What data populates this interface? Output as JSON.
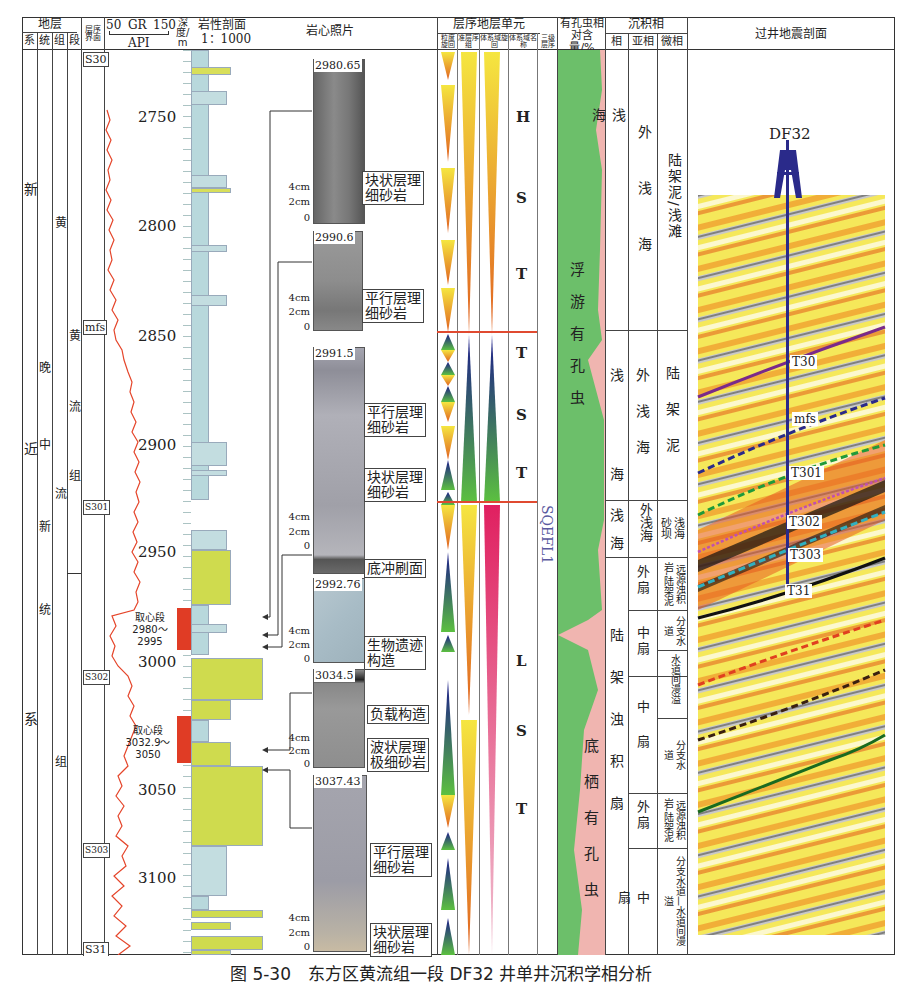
{
  "header": {
    "strata": "地层",
    "strata_sub": [
      "系",
      "统",
      "组",
      "段"
    ],
    "seq_boundary": "层序界面",
    "gr_min": "50",
    "gr_label": "GR",
    "gr_max": "150",
    "gr_unit": "API",
    "depth_label": "深度/m",
    "litho_label": "岩性剖面",
    "litho_scale": "1：1000",
    "core_photo": "岩心照片",
    "seq_unit": "层序地层单元",
    "seq_sub": [
      "粒度旋回",
      "准层序组",
      "体系域旋回",
      "体系域名称",
      "三级层序"
    ],
    "foram": "有孔虫相对含量/%",
    "facies": "沉积相",
    "facies_sub": [
      "相",
      "亚相",
      "微相"
    ],
    "seismic": "过井地震剖面"
  },
  "strata": {
    "system": [
      "新",
      "近",
      "系"
    ],
    "series": [
      "晚",
      "中",
      "新",
      "统"
    ],
    "formation_upper": [
      "黄",
      "流",
      "组"
    ],
    "formation_lower": [
      "黄",
      "流",
      "组"
    ],
    "member_upper": [
      "黄",
      "流",
      "组"
    ]
  },
  "seq_boundaries": [
    {
      "label": "S30",
      "y": 58
    },
    {
      "label": "mfs",
      "y": 325
    },
    {
      "label": "S301",
      "y": 500
    },
    {
      "label": "S302",
      "y": 670
    },
    {
      "label": "S303",
      "y": 843
    },
    {
      "label": "S31",
      "y": 940
    }
  ],
  "depth_ticks": [
    {
      "label": "2750",
      "y": 118
    },
    {
      "label": "2800",
      "y": 227
    },
    {
      "label": "2850",
      "y": 337
    },
    {
      "label": "2900",
      "y": 446
    },
    {
      "label": "2950",
      "y": 553
    },
    {
      "label": "3000",
      "y": 663
    },
    {
      "label": "3050",
      "y": 791
    },
    {
      "label": "3100",
      "y": 879
    }
  ],
  "core_intervals": [
    {
      "label": "取心段",
      "range": "2980～2995",
      "y": 608,
      "h": 42
    },
    {
      "label": "取心段",
      "range": "3032.9～3050",
      "y": 716,
      "h": 47
    }
  ],
  "core_photos": [
    {
      "depth": "2980.65",
      "notes": [
        {
          "l1": "块状层理",
          "l2": "细砂岩"
        }
      ]
    },
    {
      "depth": "2990.6",
      "notes": [
        {
          "l1": "平行层理",
          "l2": "细砂岩"
        }
      ]
    },
    {
      "depth": "2991.5",
      "notes": [
        {
          "l1": "平行层理",
          "l2": "细砂岩"
        },
        {
          "l1": "块状层理",
          "l2": "细砂岩"
        },
        {
          "l1": "底冲刷面",
          "l2": ""
        }
      ]
    },
    {
      "depth": "2992.76",
      "notes": [
        {
          "l1": "生物遗迹",
          "l2": "构造"
        }
      ]
    },
    {
      "depth": "3034.5",
      "notes": [
        {
          "l1": "负载构造",
          "l2": ""
        },
        {
          "l1": "波状层理",
          "l2": "极细砂岩"
        }
      ]
    },
    {
      "depth": "3037.43",
      "notes": [
        {
          "l1": "平行层理",
          "l2": "细砂岩"
        },
        {
          "l1": "块状层理",
          "l2": "细砂岩"
        }
      ]
    }
  ],
  "scale_labels": [
    "4cm",
    "2cm",
    "0"
  ],
  "systems_tracts": [
    {
      "letters": [
        "H",
        "S",
        "T"
      ]
    },
    {
      "letters": [
        "T",
        "S",
        "T"
      ]
    },
    {
      "letters": [
        "L",
        "S",
        "T"
      ]
    }
  ],
  "third_order_sequence": "SQEFL1",
  "foram_labels": {
    "planktonic": [
      "浮",
      "游",
      "有",
      "孔",
      "虫"
    ],
    "benthic": [
      "底",
      "栖",
      "有",
      "孔",
      "虫"
    ]
  },
  "facies_rows": [
    {
      "facies": "浅海",
      "subfacies": "外浅海",
      "micro": "陆架泥/浅滩"
    },
    {
      "facies": "浅海",
      "subfacies": "外浅海",
      "micro": "陆架泥"
    },
    {
      "facies": "浅海",
      "subfacies": "外浅海",
      "micro": "浅海砂坝"
    },
    {
      "facies": "陆架浊积扇",
      "subfacies": "外扇",
      "micro": "远源浊积岩-陆架泥"
    },
    {
      "facies": "",
      "subfacies": "中扇",
      "micro": "分支水道"
    },
    {
      "facies": "",
      "subfacies": "",
      "micro": "水道间漫溢"
    },
    {
      "facies": "",
      "subfacies": "中扇",
      "micro": "分支水道"
    },
    {
      "facies": "",
      "subfacies": "外扇",
      "micro": "远源浊积岩-陆架泥"
    },
    {
      "facies": "",
      "subfacies": "中扇",
      "micro": "分支水道—水道间漫溢"
    }
  ],
  "seismic": {
    "well": "DF32",
    "horizons": [
      {
        "label": "T30",
        "color": "#7a2a8a",
        "style": "solid"
      },
      {
        "label": "mfs",
        "color": "#2a2a8a",
        "style": "dashed"
      },
      {
        "label": "T301",
        "color": "#1f9a3a",
        "style": "dashed"
      },
      {
        "label": "T302",
        "color": "#c050b0",
        "style": "dotted"
      },
      {
        "label": "T303",
        "color": "#30b0c0",
        "style": "dashed"
      },
      {
        "label": "T31",
        "color": "#111111",
        "style": "solid"
      }
    ],
    "unlabeled_horizons": [
      {
        "color": "#e04020",
        "style": "dashed"
      },
      {
        "color": "#3a2010",
        "style": "dashed"
      },
      {
        "color": "#1a6a20",
        "style": "solid"
      }
    ]
  },
  "caption": "图 5-30　东方区黄流组一段 DF32 井单井沉积学相分析"
}
